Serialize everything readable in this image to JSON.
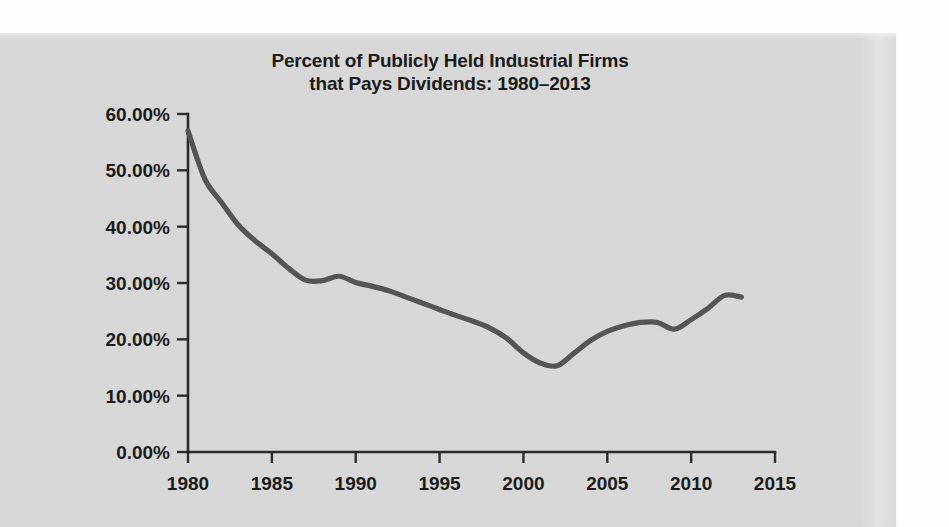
{
  "figure": {
    "background_color": "#d9d9d9",
    "page_color": "#ffffff",
    "line_color": "#555555",
    "axis_color": "#2b2b2b",
    "text_color": "#1a1a1a"
  },
  "title": {
    "line1": "Percent of Publicly Held Industrial Firms",
    "line2": "that Pays Dividends: 1980–2013"
  },
  "axes": {
    "y_tick_labels": [
      "60.00%",
      "50.00%",
      "40.00%",
      "30.00%",
      "20.00%",
      "10.00%",
      "0.00%"
    ],
    "x_tick_labels": [
      "1980",
      "1985",
      "1990",
      "1995",
      "2000",
      "2005",
      "2010",
      "2015"
    ]
  },
  "chart_data": {
    "type": "line",
    "title": "Percent of Publicly Held Industrial Firms that Pays Dividends: 1980–2013",
    "xlabel": "",
    "ylabel": "",
    "xlim": [
      1980,
      2015
    ],
    "ylim": [
      0,
      60
    ],
    "grid": false,
    "legend": false,
    "x_ticks": [
      1980,
      1985,
      1990,
      1995,
      2000,
      2005,
      2010,
      2015
    ],
    "y_ticks": [
      0,
      10,
      20,
      30,
      40,
      50,
      60
    ],
    "y_tick_format": "0.00%",
    "x": [
      1980,
      1981,
      1982,
      1983,
      1984,
      1985,
      1986,
      1987,
      1988,
      1989,
      1990,
      1991,
      1992,
      1993,
      1994,
      1995,
      1996,
      1997,
      1998,
      1999,
      2000,
      2001,
      2002,
      2003,
      2004,
      2005,
      2006,
      2007,
      2008,
      2009,
      2010,
      2011,
      2012,
      2013
    ],
    "values": [
      57.0,
      48.5,
      44.3,
      40.3,
      37.5,
      35.2,
      32.6,
      30.5,
      30.4,
      31.2,
      30.1,
      29.4,
      28.6,
      27.5,
      26.4,
      25.3,
      24.2,
      23.2,
      22.0,
      20.2,
      17.6,
      15.8,
      15.3,
      17.5,
      19.8,
      21.4,
      22.4,
      23.0,
      23.0,
      21.8,
      23.5,
      25.5,
      27.8,
      27.5
    ],
    "series": [
      {
        "name": "Percent of publicly held industrial firms that pays dividends",
        "values": [
          57.0,
          48.5,
          44.3,
          40.3,
          37.5,
          35.2,
          32.6,
          30.5,
          30.4,
          31.2,
          30.1,
          29.4,
          28.6,
          27.5,
          26.4,
          25.3,
          24.2,
          23.2,
          22.0,
          20.2,
          17.6,
          15.8,
          15.3,
          17.5,
          19.8,
          21.4,
          22.4,
          23.0,
          23.0,
          21.8,
          23.5,
          25.5,
          27.8,
          27.5
        ]
      }
    ]
  }
}
